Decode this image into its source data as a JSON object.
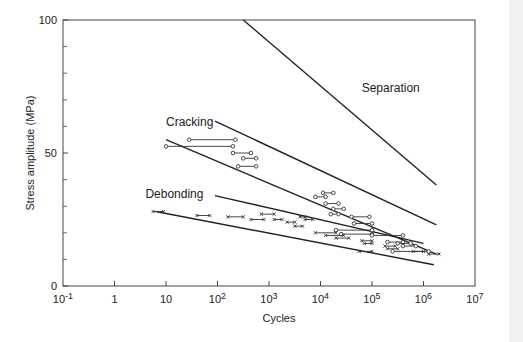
{
  "chart_data": {
    "type": "line",
    "title": "",
    "xlabel": "Cycles",
    "ylabel": "Stress amplitude (MPa)",
    "xscale": "log",
    "xlim_exp": [
      -1,
      7
    ],
    "ylim": [
      0,
      100
    ],
    "x_ticks": [
      {
        "exp": -1,
        "base": "10",
        "sup": "-1"
      },
      {
        "exp": 0,
        "base": "1",
        "sup": ""
      },
      {
        "exp": 1,
        "base": "10",
        "sup": ""
      },
      {
        "exp": 2,
        "base": "10",
        "sup": "2"
      },
      {
        "exp": 3,
        "base": "10",
        "sup": "3"
      },
      {
        "exp": 4,
        "base": "10",
        "sup": "4"
      },
      {
        "exp": 5,
        "base": "10",
        "sup": "5"
      },
      {
        "exp": 6,
        "base": "10",
        "sup": "6"
      },
      {
        "exp": 7,
        "base": "10",
        "sup": "7"
      }
    ],
    "y_ticks": [
      0,
      50,
      100
    ],
    "y_minor_ticks": [
      10,
      20,
      30,
      40,
      60,
      70,
      80,
      90
    ],
    "grid": false,
    "annotations": [
      {
        "text": "Separation",
        "x_exp": 4.8,
        "y": 73
      },
      {
        "text": "Cracking",
        "x_exp": 1.0,
        "y": 60
      },
      {
        "text": "Debonding",
        "x_exp": 0.6,
        "y": 33
      }
    ],
    "series": [
      {
        "name": "Separation",
        "style": "solid",
        "points": [
          [
            2.5,
            100
          ],
          [
            6.25,
            38
          ]
        ]
      },
      {
        "name": "Cracking upper bound",
        "style": "solid",
        "points": [
          [
            1.95,
            62
          ],
          [
            6.25,
            23
          ]
        ]
      },
      {
        "name": "Cracking lower bound",
        "style": "solid",
        "points": [
          [
            1.0,
            55
          ],
          [
            6.25,
            12
          ]
        ]
      },
      {
        "name": "Debonding upper bound",
        "style": "solid",
        "points": [
          [
            1.95,
            34
          ],
          [
            6.0,
            16
          ]
        ]
      },
      {
        "name": "Debonding lower bound",
        "style": "solid",
        "points": [
          [
            0.8,
            28
          ],
          [
            6.2,
            8
          ]
        ]
      }
    ],
    "cracking_runs": [
      [
        1.0,
        2.3,
        52.5
      ],
      [
        1.45,
        2.35,
        55
      ],
      [
        2.3,
        2.65,
        50
      ],
      [
        2.5,
        2.75,
        48
      ],
      [
        2.4,
        2.75,
        45
      ],
      [
        3.9,
        4.1,
        33.5
      ],
      [
        4.05,
        4.25,
        35
      ],
      [
        4.1,
        4.35,
        31
      ],
      [
        4.25,
        4.45,
        29
      ],
      [
        4.2,
        4.35,
        27
      ],
      [
        4.6,
        4.95,
        26
      ],
      [
        4.65,
        5.0,
        23.5
      ],
      [
        4.3,
        5.0,
        21
      ],
      [
        4.4,
        5.0,
        19.5
      ],
      [
        5.0,
        5.6,
        19
      ],
      [
        5.3,
        5.6,
        16.5
      ],
      [
        5.5,
        5.75,
        16
      ],
      [
        5.6,
        5.85,
        15
      ],
      [
        5.4,
        6.1,
        13
      ]
    ],
    "debonding_runs": [
      [
        0.75,
        0.95,
        28
      ],
      [
        1.6,
        1.85,
        26.5
      ],
      [
        2.2,
        2.5,
        26
      ],
      [
        2.65,
        2.9,
        25
      ],
      [
        2.85,
        3.1,
        27
      ],
      [
        3.1,
        3.25,
        25
      ],
      [
        3.35,
        3.5,
        24
      ],
      [
        3.5,
        3.65,
        22.5
      ],
      [
        3.6,
        3.7,
        26
      ],
      [
        3.7,
        3.85,
        25
      ],
      [
        3.9,
        4.3,
        20
      ],
      [
        4.1,
        4.45,
        19
      ],
      [
        4.3,
        4.55,
        18
      ],
      [
        4.8,
        5.0,
        17
      ],
      [
        4.85,
        5.0,
        16
      ],
      [
        4.75,
        5.0,
        13
      ],
      [
        5.25,
        5.45,
        15
      ],
      [
        5.3,
        5.5,
        14
      ],
      [
        5.8,
        6.0,
        13
      ],
      [
        6.1,
        6.3,
        12
      ]
    ]
  }
}
